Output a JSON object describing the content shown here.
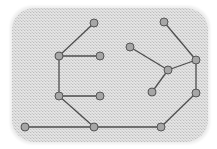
{
  "diagram": {
    "type": "graph",
    "background": {
      "x": 12,
      "y": 8,
      "width": 196,
      "height": 134,
      "radius": 22,
      "fill": "#d9d9d9",
      "pattern_dark": "#bdbdbd",
      "pattern_light": "#ececec"
    },
    "style": {
      "edge_color": "#4d4d4d",
      "edge_width": 1.3,
      "node_fill": "#a6a6a6",
      "node_stroke": "#555555",
      "node_radius": 4
    },
    "nodes": [
      {
        "id": "A",
        "x": 94,
        "y": 23
      },
      {
        "id": "B",
        "x": 59,
        "y": 56
      },
      {
        "id": "C",
        "x": 100,
        "y": 56
      },
      {
        "id": "D",
        "x": 59,
        "y": 96
      },
      {
        "id": "E",
        "x": 100,
        "y": 96
      },
      {
        "id": "F",
        "x": 94,
        "y": 127
      },
      {
        "id": "G",
        "x": 25,
        "y": 127
      },
      {
        "id": "H",
        "x": 161,
        "y": 127
      },
      {
        "id": "I",
        "x": 196,
        "y": 93
      },
      {
        "id": "J",
        "x": 196,
        "y": 60
      },
      {
        "id": "K",
        "x": 168,
        "y": 70
      },
      {
        "id": "L",
        "x": 130,
        "y": 47
      },
      {
        "id": "M",
        "x": 164,
        "y": 22
      },
      {
        "id": "N",
        "x": 152,
        "y": 92
      }
    ],
    "edges": [
      [
        "A",
        "B"
      ],
      [
        "B",
        "C"
      ],
      [
        "B",
        "D"
      ],
      [
        "D",
        "E"
      ],
      [
        "D",
        "F"
      ],
      [
        "G",
        "F"
      ],
      [
        "F",
        "H"
      ],
      [
        "H",
        "I"
      ],
      [
        "I",
        "J"
      ],
      [
        "J",
        "M"
      ],
      [
        "J",
        "K"
      ],
      [
        "K",
        "L"
      ],
      [
        "K",
        "N"
      ]
    ]
  }
}
